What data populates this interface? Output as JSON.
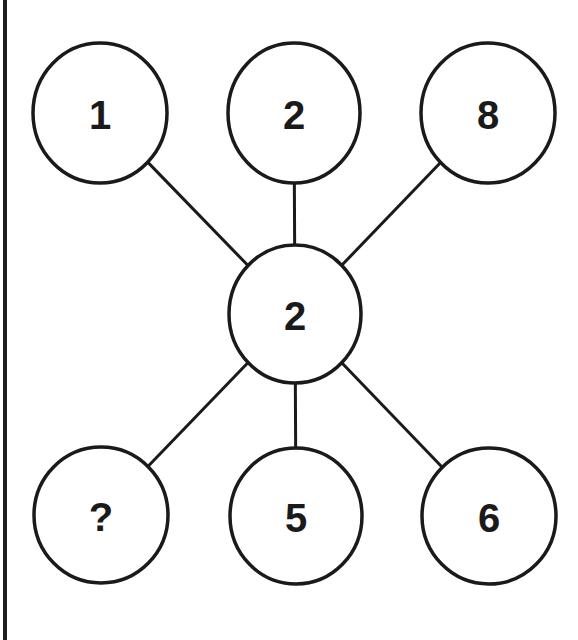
{
  "puzzle": {
    "colors": {
      "stroke": "#1a1a1a",
      "fill": "#ffffff",
      "border": "#1e1e1e"
    },
    "center": {
      "label": "2",
      "cx": 295,
      "cy": 314,
      "rx": 66,
      "ry": 69
    },
    "outer_nodes": [
      {
        "id": "top-left",
        "label": "1",
        "cx": 100,
        "cy": 113,
        "rx": 67,
        "ry": 70
      },
      {
        "id": "top-middle",
        "label": "2",
        "cx": 294,
        "cy": 113,
        "rx": 66,
        "ry": 70
      },
      {
        "id": "top-right",
        "label": "8",
        "cx": 488,
        "cy": 113,
        "rx": 67,
        "ry": 70
      },
      {
        "id": "bottom-left",
        "label": "?",
        "cx": 101,
        "cy": 515,
        "rx": 67,
        "ry": 68
      },
      {
        "id": "bottom-middle",
        "label": "5",
        "cx": 296,
        "cy": 516,
        "rx": 66,
        "ry": 68
      },
      {
        "id": "bottom-right",
        "label": "6",
        "cx": 489,
        "cy": 516,
        "rx": 67,
        "ry": 68
      }
    ]
  }
}
